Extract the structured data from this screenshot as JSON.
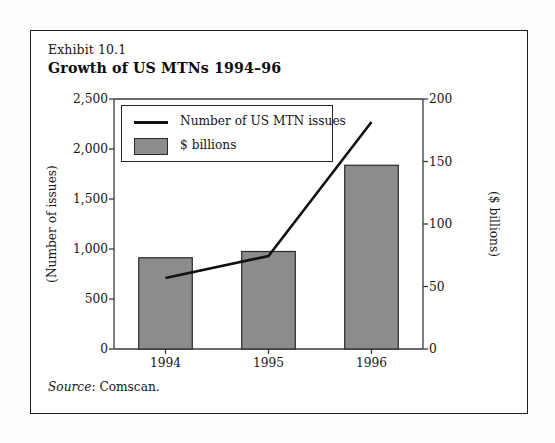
{
  "exhibit": {
    "label": "Exhibit 10.1",
    "title": "Growth of US MTNs 1994–96",
    "source_word": "Source",
    "source_sep": ": ",
    "source_text": "Comscan."
  },
  "legend": {
    "items": [
      {
        "label": "Number of US MTN issues",
        "marker": "line",
        "color": "#111114"
      },
      {
        "label": "$ billions",
        "marker": "box",
        "color": "#8c8c8c"
      }
    ]
  },
  "colors": {
    "bar_fill": "#8c8c8c",
    "bar_stroke": "#2a2a2e",
    "line": "#111114",
    "axis": "#3a3a3e",
    "frame": "#1d1d1d",
    "text": "#16161a",
    "background": "#ffffff"
  },
  "chart_data": {
    "type": "bar",
    "title": "Growth of US MTNs 1994–96",
    "subtitle": "Exhibit 10.1",
    "source": "Source: Comscan.",
    "categories": [
      "1994",
      "1995",
      "1996"
    ],
    "xlabel": "",
    "grid": false,
    "legend_position": "top-left-inside",
    "axes": {
      "left": {
        "label": "(Number of issues)",
        "ticks": [
          "0",
          "500",
          "1,000",
          "1,500",
          "2,000",
          "2,500"
        ],
        "tick_values": [
          0,
          500,
          1000,
          1500,
          2000,
          2500
        ],
        "ylim": [
          0,
          2500
        ]
      },
      "right": {
        "label": "($ billions)",
        "ticks": [
          "0",
          "50",
          "100",
          "150",
          "200"
        ],
        "tick_values": [
          0,
          50,
          100,
          150,
          200
        ],
        "ylim": [
          0,
          200
        ]
      }
    },
    "series": [
      {
        "name": "$ billions",
        "type": "bar",
        "axis": "right",
        "values": [
          73,
          78,
          147
        ],
        "color": "#8c8c8c"
      },
      {
        "name": "Number of US MTN issues",
        "type": "line",
        "axis": "left",
        "values": [
          710,
          930,
          2270
        ],
        "color": "#111114"
      }
    ]
  }
}
